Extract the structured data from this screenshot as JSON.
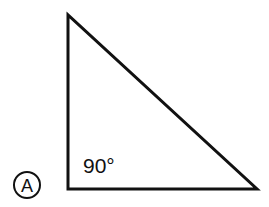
{
  "figure": {
    "option_label": "A",
    "angle_label": "90°",
    "shape": "right triangle",
    "stroke_color": "#111111",
    "background": "#ffffff"
  }
}
